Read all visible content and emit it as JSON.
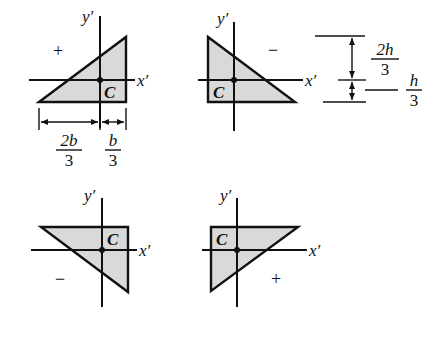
{
  "diagram": {
    "colors": {
      "fill": "#d9d9d9",
      "stroke": "#111111",
      "background": "#ffffff"
    },
    "axis_labels": {
      "x": "x′",
      "y": "y′",
      "centroid": "C"
    },
    "panels": [
      {
        "id": "top-left",
        "sign": "+",
        "orientation": "right angle bottom-right"
      },
      {
        "id": "top-right",
        "sign": "−",
        "orientation": "right angle bottom-left"
      },
      {
        "id": "bottom-left",
        "sign": "−",
        "orientation": "right angle top-right"
      },
      {
        "id": "bottom-right",
        "sign": "+",
        "orientation": "right angle top-left"
      }
    ],
    "dimensions": {
      "width_left": {
        "num": "2b",
        "den": "3"
      },
      "width_right": {
        "num": "b",
        "den": "3"
      },
      "height_top": {
        "num": "2h",
        "den": "3"
      },
      "height_bottom": {
        "num": "h",
        "den": "3"
      }
    }
  }
}
